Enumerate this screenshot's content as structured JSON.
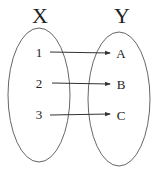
{
  "diagram": {
    "sets": [
      {
        "id": "X",
        "title": "X",
        "elements": [
          "1",
          "2",
          "3"
        ]
      },
      {
        "id": "Y",
        "title": "Y",
        "elements": [
          "A",
          "B",
          "C"
        ]
      }
    ],
    "mappings": [
      {
        "from": "1",
        "to": "A"
      },
      {
        "from": "2",
        "to": "B"
      },
      {
        "from": "3",
        "to": "C"
      }
    ],
    "colors": {
      "stroke": "#555555",
      "text": "#222222",
      "background": "#ffffff"
    }
  }
}
